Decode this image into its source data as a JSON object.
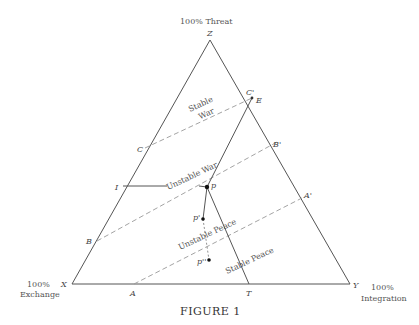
{
  "figure": {
    "caption": "FIGURE 1",
    "corners": {
      "top": {
        "vertex": "Z",
        "label": "100% Threat"
      },
      "left": {
        "vertex": "X",
        "label_line1": "100%",
        "label_line2": "Exchange"
      },
      "right": {
        "vertex": "Y",
        "label_line1": "100%",
        "label_line2": "Integration"
      }
    },
    "edge_points": {
      "C_prime": "C'",
      "E": "E",
      "B_prime": "B'",
      "A_prime": "A'",
      "C": "C",
      "I": "I",
      "B": "B",
      "A": "A",
      "T": "T"
    },
    "interior_points": {
      "p": "p",
      "p_prime": "p'",
      "p_double_prime": "p''"
    },
    "regions": {
      "stable_war_1": "Stable",
      "stable_war_2": "War",
      "unstable_war": "Unstable War",
      "unstable_peace": "Unstable Peace",
      "stable_peace": "Stable Peace"
    }
  }
}
